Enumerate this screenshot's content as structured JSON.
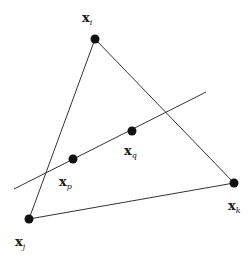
{
  "diagram": {
    "type": "triangle-with-intersecting-line",
    "stroke_color": "#333333",
    "point_color": "#111111",
    "vertices": [
      {
        "id": "xi",
        "label": "x",
        "subscript": "i",
        "x": 95,
        "y": 39,
        "label_x": 82,
        "label_y": 22
      },
      {
        "id": "xj",
        "label": "x",
        "subscript": "j",
        "x": 29,
        "y": 219,
        "label_x": 15,
        "label_y": 246
      },
      {
        "id": "xk",
        "label": "x",
        "subscript": "k",
        "x": 234,
        "y": 183,
        "label_x": 228,
        "label_y": 210
      }
    ],
    "line_points": [
      {
        "id": "xp",
        "label": "x",
        "subscript": "p",
        "x": 73,
        "y": 159,
        "label_x": 59,
        "label_y": 186
      },
      {
        "id": "xq",
        "label": "x",
        "subscript": "q",
        "x": 132,
        "y": 131,
        "label_x": 124,
        "label_y": 155
      }
    ],
    "line": {
      "x1": 14,
      "y1": 189,
      "x2": 206,
      "y2": 92
    }
  }
}
